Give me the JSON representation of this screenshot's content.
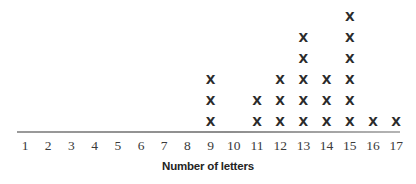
{
  "chart_data": {
    "type": "bar",
    "subtype": "dot-plot",
    "title": "",
    "xlabel": "Number of letters",
    "ylabel": "",
    "grid": false,
    "legend": null,
    "mark_glyph": "X",
    "mark_color": "#2b2b2b",
    "axis_color": "#8d8d8d",
    "background_color": "#ffffff",
    "xlim": [
      1,
      17
    ],
    "categories": [
      "1",
      "2",
      "3",
      "4",
      "5",
      "6",
      "7",
      "8",
      "9",
      "10",
      "11",
      "12",
      "13",
      "14",
      "15",
      "16",
      "17"
    ],
    "values": [
      0,
      0,
      0,
      0,
      0,
      0,
      0,
      0,
      3,
      0,
      2,
      3,
      5,
      3,
      6,
      1,
      1
    ],
    "total_count": 24,
    "max_stack": 6
  },
  "axis": {
    "title": "Number of letters"
  }
}
